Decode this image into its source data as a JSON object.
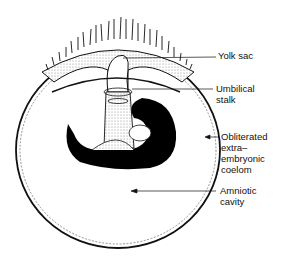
{
  "figure": {
    "type": "embryo cross-section diagram",
    "labels": {
      "yolk_sac": "Yolk sac",
      "umbilical_stalk_1": "Umbilical",
      "umbilical_stalk_2": "stalk",
      "coelom_1": "Obliterated",
      "coelom_2": "extra–",
      "coelom_3": "embryonic",
      "coelom_4": "coelom",
      "amnion_1": "Amniotic",
      "amnion_2": "cavity"
    },
    "colors": {
      "ink": "#111111",
      "stipple": "#d8d8d8",
      "background": "#ffffff"
    }
  }
}
